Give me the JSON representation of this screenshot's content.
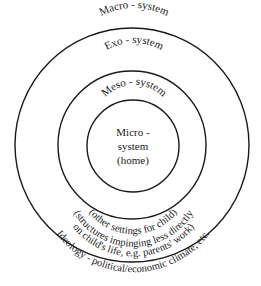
{
  "diagram": {
    "type": "nested-circles",
    "rings": [
      {
        "id": "macro",
        "label": "Macro - system",
        "description": "Ideology - political/economic climate, etc."
      },
      {
        "id": "exo",
        "label": "Exo - system",
        "description_line1": "(structures impinging less directly",
        "description_line2": "on child's life, e.g. parents' work)"
      },
      {
        "id": "meso",
        "label": "Meso - system",
        "description": "(other settings for child)"
      },
      {
        "id": "micro",
        "label_line1": "Micro -",
        "label_line2": "system",
        "label_line3": "(home)"
      }
    ],
    "colors": {
      "stroke": "#1a1a1a",
      "text": "#1a1a1a",
      "background": "#ffffff"
    }
  }
}
